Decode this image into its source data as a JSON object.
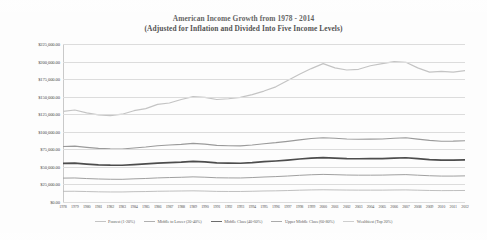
{
  "chart_data": {
    "type": "line",
    "title": "American Income Growth from 1978 - 2014",
    "subtitle": "(Adjusted for Inflation and Divided Into Five Income Levels)",
    "xlabel": "",
    "ylabel": "",
    "grid": true,
    "legend_position": "bottom",
    "ylim": [
      0,
      225000
    ],
    "ytick_labels": [
      "$225,000.00",
      "$200,000.00",
      "$175,000.00",
      "$150,000.00",
      "$125,000.00",
      "$100,000.00",
      "$75,000.00",
      "$50,000.00",
      "$25,000.00",
      "$0.00"
    ],
    "ytick_values": [
      225000,
      200000,
      175000,
      150000,
      125000,
      100000,
      75000,
      50000,
      25000,
      0
    ],
    "x": [
      1978,
      1979,
      1980,
      1981,
      1982,
      1983,
      1984,
      1985,
      1986,
      1987,
      1988,
      1989,
      1990,
      1991,
      1992,
      1993,
      1994,
      1995,
      1996,
      1997,
      1998,
      1999,
      2000,
      2001,
      2002,
      2003,
      2004,
      2005,
      2006,
      2007,
      2008,
      2009,
      2010,
      2011,
      2012
    ],
    "categories": [
      "1978",
      "1979",
      "1980",
      "1981",
      "1982",
      "1983",
      "1984",
      "1985",
      "1986",
      "1987",
      "1988",
      "1989",
      "1990",
      "1991",
      "1992",
      "1993",
      "1994",
      "1995",
      "1996",
      "1997",
      "1998",
      "1999",
      "2000",
      "2001",
      "2002",
      "2003",
      "2004",
      "2005",
      "2006",
      "2007",
      "2008",
      "2009",
      "2010",
      "2011",
      "2012"
    ],
    "series": [
      {
        "name": "Poorest (1-20%)",
        "color": "#b8b8b8",
        "width": 0.9,
        "values": [
          15200,
          15300,
          14900,
          14500,
          14300,
          14300,
          14700,
          14900,
          15300,
          15500,
          15700,
          15900,
          15600,
          15100,
          15000,
          15000,
          15300,
          15700,
          15900,
          16300,
          16800,
          17200,
          17400,
          17200,
          17000,
          16900,
          16900,
          16900,
          17100,
          17200,
          16800,
          16400,
          16200,
          16300,
          16400
        ]
      },
      {
        "name": "Middle to Lower (20-40%)",
        "color": "#a0a0a0",
        "width": 1.0,
        "values": [
          34000,
          34200,
          33400,
          32800,
          32400,
          32300,
          33000,
          33500,
          34300,
          34800,
          35200,
          35800,
          35300,
          34500,
          34300,
          34200,
          34800,
          35600,
          36200,
          37000,
          38000,
          38800,
          39300,
          38900,
          38400,
          38200,
          38200,
          38300,
          38700,
          39000,
          38200,
          37400,
          36900,
          36900,
          37200
        ]
      },
      {
        "name": "Middle Class (40-60%)",
        "color": "#4d4d4d",
        "width": 1.7,
        "values": [
          55000,
          55300,
          54000,
          53000,
          52400,
          52300,
          53300,
          54200,
          55400,
          56200,
          56800,
          57800,
          57000,
          55700,
          55300,
          55200,
          56100,
          57400,
          58400,
          59700,
          61200,
          62500,
          63200,
          62600,
          61900,
          61600,
          61700,
          61900,
          62500,
          63000,
          61700,
          60400,
          59600,
          59600,
          60000
        ]
      },
      {
        "name": "Upper Middle Class (60-80%)",
        "color": "#9a9a9a",
        "width": 1.1,
        "values": [
          79000,
          79500,
          77800,
          76400,
          75600,
          75500,
          77000,
          78300,
          80000,
          81200,
          82100,
          83500,
          82400,
          80600,
          80100,
          79900,
          81200,
          83000,
          84500,
          86400,
          88500,
          90400,
          91500,
          90700,
          89700,
          89400,
          89500,
          89800,
          90700,
          91400,
          89600,
          87700,
          86600,
          86700,
          87300
        ]
      },
      {
        "name": "Wealthiest (Top 20%)",
        "color": "#c4c4c4",
        "width": 1.2,
        "values": [
          129000,
          131000,
          127000,
          124000,
          123000,
          125000,
          130000,
          133000,
          139000,
          141000,
          146000,
          150000,
          149000,
          146000,
          147000,
          149000,
          153000,
          158000,
          164000,
          173000,
          182000,
          190000,
          197000,
          191000,
          188000,
          189000,
          194000,
          197000,
          200000,
          199000,
          191000,
          185000,
          186000,
          185000,
          187000
        ]
      }
    ]
  }
}
